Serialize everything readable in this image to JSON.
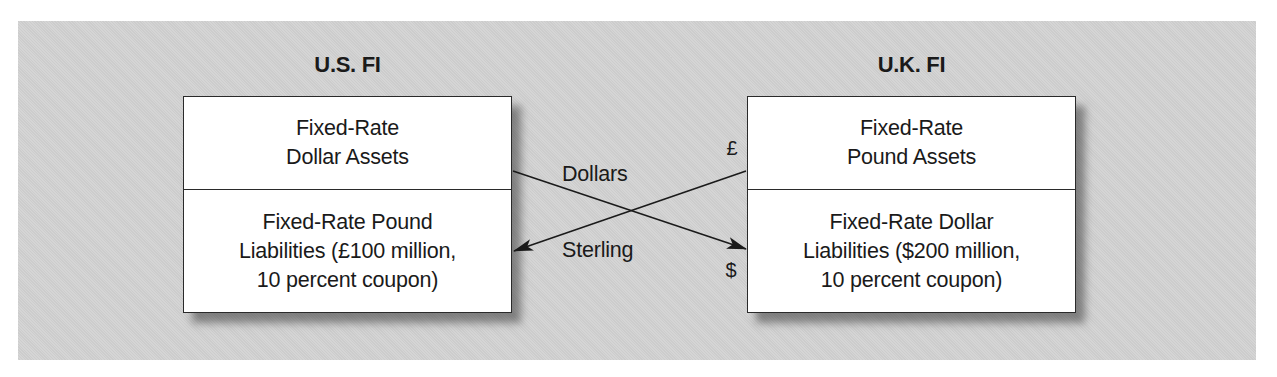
{
  "diagram": {
    "left_party": {
      "title": "U.S. FI",
      "assets": [
        "Fixed-Rate",
        "Dollar Assets"
      ],
      "liabilities": [
        "Fixed-Rate Pound",
        "Liabilities (£100 million,",
        "10 percent coupon)"
      ]
    },
    "right_party": {
      "title": "U.K. FI",
      "assets": [
        "Fixed-Rate",
        "Pound Assets"
      ],
      "liabilities": [
        "Fixed-Rate Dollar",
        "Liabilities ($200 million,",
        "10 percent coupon)"
      ]
    },
    "flows": [
      {
        "label": "Dollars",
        "from": "U.S. FI assets",
        "to": "U.K. FI liabilities",
        "end_symbol": "$"
      },
      {
        "label": "Sterling",
        "from": "U.K. FI assets",
        "to": "U.S. FI liabilities",
        "start_symbol": "£"
      }
    ],
    "symbols": {
      "pound": "£",
      "dollar": "$"
    },
    "colors": {
      "background": "#d3d3d3",
      "box": "#ffffff",
      "stroke": "#1a1a1a"
    }
  }
}
